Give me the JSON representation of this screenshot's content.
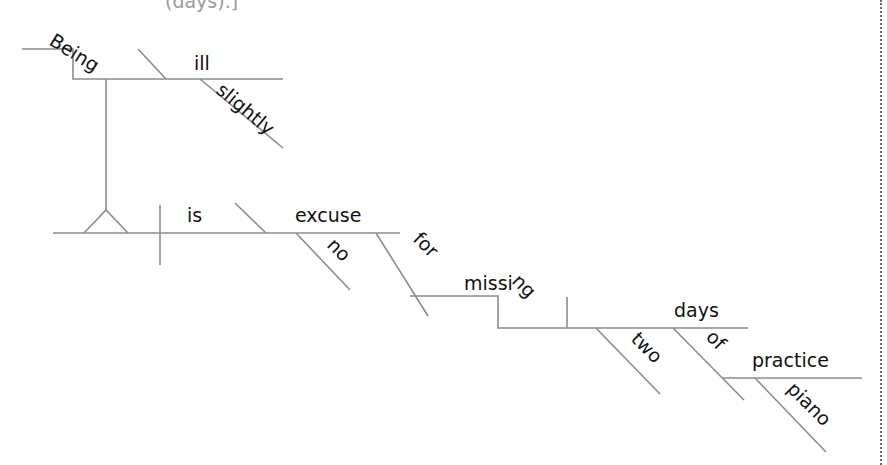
{
  "caption": "(days).]",
  "diagram": {
    "type": "Reed-Kellogg sentence diagram",
    "sentence": "Being slightly ill is no excuse for missing two days of piano practice.",
    "words": {
      "being": "Being",
      "ill": "ill",
      "slightly": "slightly",
      "is": "is",
      "excuse": "excuse",
      "no": "no",
      "for": "for",
      "missing": "missing",
      "days": "days",
      "two": "two",
      "of": "of",
      "practice": "practice",
      "piano": "piano"
    },
    "colors": {
      "line": "#8c8c8c",
      "text": "#111111",
      "caption": "#9a9a9a",
      "border": "#6a6a6a"
    }
  }
}
